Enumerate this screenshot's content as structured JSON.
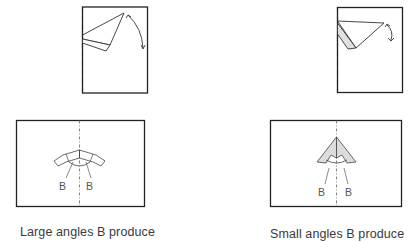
{
  "figure": {
    "panels": [
      {
        "id": "large-angle",
        "top_view": {
          "rect": [
            82,
            6,
            148,
            93
          ],
          "fold_axis_x": 82
        },
        "bottom_view": {
          "rect": [
            16,
            120,
            145,
            207
          ],
          "center_x": 79
        },
        "angle_labels": [
          "B",
          "B"
        ],
        "caption": "Large angles B produce"
      },
      {
        "id": "small-angle",
        "top_view": {
          "rect": [
            337,
            7,
            403,
            93
          ],
          "fold_axis_x": 337
        },
        "bottom_view": {
          "rect": [
            270,
            120,
            402,
            207
          ],
          "center_x": 336
        },
        "angle_labels": [
          "B",
          "B"
        ],
        "caption": "Small angles B produce"
      }
    ],
    "colors": {
      "line": "#222222",
      "light_line": "#666666",
      "shade": "#d9d9d9",
      "text": "#3a3a3a"
    }
  }
}
